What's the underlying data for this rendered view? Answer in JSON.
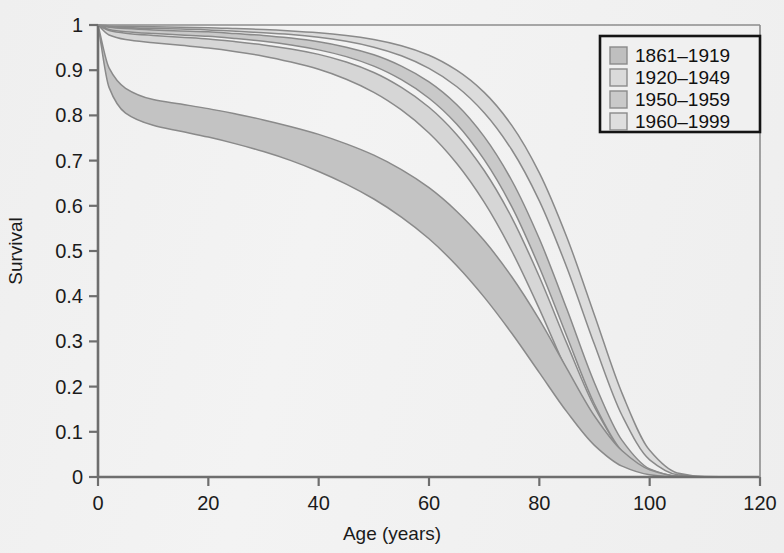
{
  "chart_data": {
    "type": "area",
    "title": "",
    "xlabel": "Age (years)",
    "ylabel": "Survival",
    "xlim": [
      0,
      120
    ],
    "ylim": [
      0,
      1
    ],
    "grid": false,
    "legend_position": "top-right",
    "x_ticks": [
      "0",
      "20",
      "40",
      "60",
      "80",
      "100",
      "120"
    ],
    "x_tick_values": [
      0,
      20,
      40,
      60,
      80,
      100,
      120
    ],
    "y_ticks": [
      "0",
      "0.1",
      "0.2",
      "0.3",
      "0.4",
      "0.5",
      "0.6",
      "0.7",
      "0.8",
      "0.9",
      "1"
    ],
    "y_tick_values": [
      0,
      0.1,
      0.2,
      0.3,
      0.4,
      0.5,
      0.6,
      0.7,
      0.8,
      0.9,
      1
    ],
    "x": [
      0,
      2,
      5,
      10,
      15,
      20,
      25,
      30,
      35,
      40,
      45,
      50,
      55,
      60,
      65,
      70,
      75,
      80,
      85,
      90,
      95,
      100,
      105,
      110,
      115,
      120
    ],
    "series": [
      {
        "name": "1861-1919",
        "fill": "#c3c3c3",
        "upper": [
          1.0,
          0.905,
          0.86,
          0.835,
          0.825,
          0.815,
          0.803,
          0.79,
          0.775,
          0.758,
          0.737,
          0.712,
          0.68,
          0.64,
          0.588,
          0.523,
          0.443,
          0.348,
          0.24,
          0.135,
          0.058,
          0.016,
          0.002,
          0.0,
          0.0,
          0.0
        ],
        "lower": [
          1.0,
          0.862,
          0.805,
          0.778,
          0.765,
          0.752,
          0.737,
          0.72,
          0.7,
          0.676,
          0.648,
          0.615,
          0.575,
          0.527,
          0.468,
          0.398,
          0.318,
          0.231,
          0.144,
          0.07,
          0.024,
          0.005,
          0.0,
          0.0,
          0.0,
          0.0
        ]
      },
      {
        "name": "1920-1949",
        "fill": "#d6d6d6",
        "upper": [
          1.0,
          0.988,
          0.982,
          0.977,
          0.973,
          0.969,
          0.963,
          0.956,
          0.947,
          0.935,
          0.918,
          0.895,
          0.862,
          0.818,
          0.758,
          0.678,
          0.574,
          0.443,
          0.295,
          0.155,
          0.058,
          0.013,
          0.001,
          0.0,
          0.0,
          0.0
        ],
        "lower": [
          1.0,
          0.978,
          0.968,
          0.961,
          0.955,
          0.949,
          0.941,
          0.931,
          0.918,
          0.902,
          0.88,
          0.851,
          0.812,
          0.761,
          0.694,
          0.608,
          0.5,
          0.372,
          0.234,
          0.113,
          0.038,
          0.007,
          0.0,
          0.0,
          0.0,
          0.0
        ]
      },
      {
        "name": "1950-1959",
        "fill": "#c9c9c9",
        "upper": [
          1.0,
          0.995,
          0.992,
          0.989,
          0.987,
          0.985,
          0.981,
          0.977,
          0.971,
          0.963,
          0.951,
          0.934,
          0.909,
          0.874,
          0.824,
          0.753,
          0.656,
          0.527,
          0.371,
          0.208,
          0.081,
          0.018,
          0.002,
          0.0,
          0.0,
          0.0
        ],
        "lower": [
          1.0,
          0.99,
          0.985,
          0.981,
          0.978,
          0.975,
          0.97,
          0.964,
          0.956,
          0.945,
          0.93,
          0.909,
          0.879,
          0.838,
          0.781,
          0.702,
          0.598,
          0.464,
          0.311,
          0.161,
          0.057,
          0.011,
          0.001,
          0.0,
          0.0,
          0.0
        ]
      },
      {
        "name": "1960-1999",
        "fill": "#dcdcdc",
        "upper": [
          1.0,
          0.998,
          0.997,
          0.996,
          0.995,
          0.994,
          0.992,
          0.99,
          0.987,
          0.983,
          0.977,
          0.968,
          0.954,
          0.933,
          0.9,
          0.851,
          0.778,
          0.673,
          0.53,
          0.358,
          0.185,
          0.059,
          0.009,
          0.001,
          0.0,
          0.0
        ],
        "lower": [
          1.0,
          0.996,
          0.994,
          0.992,
          0.991,
          0.989,
          0.986,
          0.983,
          0.979,
          0.973,
          0.964,
          0.951,
          0.932,
          0.904,
          0.864,
          0.806,
          0.724,
          0.611,
          0.463,
          0.293,
          0.136,
          0.038,
          0.005,
          0.0,
          0.0,
          0.0
        ]
      }
    ],
    "legend": [
      {
        "label": "1861–1919",
        "swatch": "#bfbfbf"
      },
      {
        "label": "1920–1949",
        "swatch": "#dadada"
      },
      {
        "label": "1950–1959",
        "swatch": "#c9c9c9"
      },
      {
        "label": "1960–1999",
        "swatch": "#dedede"
      }
    ]
  }
}
